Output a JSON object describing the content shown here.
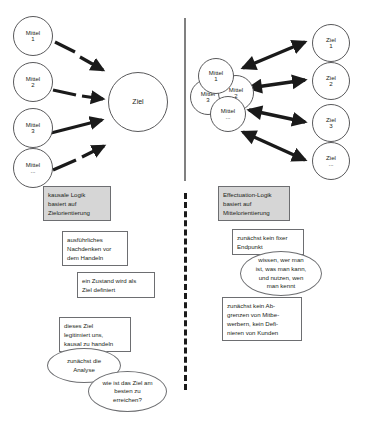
{
  "diagram": {
    "left_panel": {
      "means_nodes": [
        {
          "label": "Mittel",
          "num": "1"
        },
        {
          "label": "Mittel",
          "num": "2"
        },
        {
          "label": "Mittel",
          "num": "3"
        },
        {
          "label": "Mittel",
          "num": "..."
        }
      ],
      "goal_node": {
        "label": "Ziel",
        "num": ""
      },
      "boxes": [
        {
          "shaded": true,
          "lines": [
            "kausale Logik",
            "basiert auf",
            "Zielorientierung"
          ]
        },
        {
          "shaded": false,
          "lines": [
            "ausführliches",
            "Nachdenken vor",
            "dem Handeln"
          ]
        },
        {
          "shaded": false,
          "lines": [
            "ein Zustand wird als",
            "Ziel definiert"
          ]
        },
        {
          "shaded": false,
          "lines": [
            "dieses Ziel",
            "legitimiert uns,",
            "kausal zu handeln"
          ]
        }
      ],
      "ellipses": [
        {
          "lines": [
            "zunächst die",
            "Analyse"
          ]
        },
        {
          "lines": [
            "wie ist das Ziel am",
            "besten zu",
            "erreichen?"
          ]
        }
      ]
    },
    "right_panel": {
      "means_cluster": [
        {
          "label": "Mittel",
          "num": "1"
        },
        {
          "label": "Mittel",
          "num": "2"
        },
        {
          "label": "Mittel",
          "num": "3"
        },
        {
          "label": "Mittel",
          "num": "..."
        }
      ],
      "goal_nodes": [
        {
          "label": "Ziel",
          "num": "1"
        },
        {
          "label": "Ziel",
          "num": "2"
        },
        {
          "label": "Ziel",
          "num": "3"
        },
        {
          "label": "Ziel",
          "num": "..."
        }
      ],
      "boxes": [
        {
          "shaded": true,
          "lines": [
            "Effectuation-Logik",
            "basiert auf",
            "Mittelorientierung"
          ]
        },
        {
          "shaded": false,
          "lines": [
            "zunächst kein fixer",
            "Endpunkt"
          ]
        },
        {
          "shaded": false,
          "lines": [
            "zunächst kein Ab-",
            "grenzen von Mitbe-",
            "werbern, kein Defi-",
            "nieren von Kunden"
          ]
        }
      ],
      "ellipses": [
        {
          "lines": [
            "wissen, wer man",
            "ist, was man kann,",
            "und nutzen, wen",
            "man kennt"
          ]
        }
      ]
    },
    "colors": {
      "shaded_box_fill": "#d6d6d6",
      "outline": "#6d6e71",
      "arrow": "#1a1a1a",
      "divider_solid": "#808080",
      "divider_dashed": "#1a1a1a"
    }
  }
}
